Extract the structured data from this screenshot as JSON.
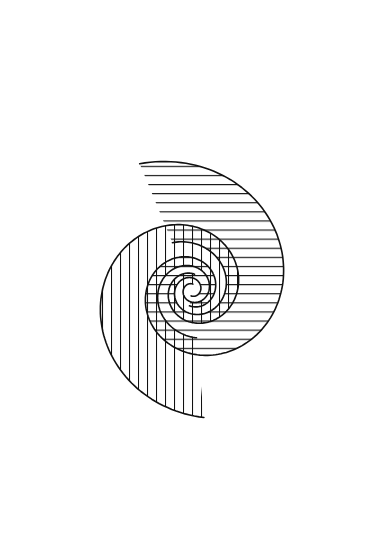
{
  "figure": {
    "title": "Double spiral line-art illustration",
    "colors": {
      "line": "#111111",
      "background": "#ffffff"
    },
    "bands": [
      {
        "name": "horizontal-hatched-spiral",
        "hatching": "horizontal",
        "hatch_spacing_px": 9,
        "open_end": "upper-left"
      },
      {
        "name": "vertical-hatched-spiral",
        "hatching": "vertical",
        "hatch_spacing_px": 9,
        "open_end": "lower-right"
      }
    ]
  }
}
